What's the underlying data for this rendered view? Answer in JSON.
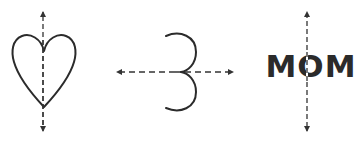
{
  "figure": {
    "colors": {
      "stroke": "#2b2b2b",
      "axis": "#333333",
      "background": "#ffffff"
    },
    "items": [
      {
        "name": "heart",
        "symmetry_axis": "vertical"
      },
      {
        "name": "numeral-3",
        "symmetry_axis": "horizontal"
      },
      {
        "name": "word",
        "label": "MOM",
        "symmetry_axis": "vertical"
      }
    ]
  }
}
